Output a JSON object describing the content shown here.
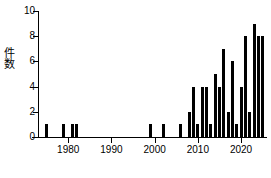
{
  "chart_data": {
    "type": "bar",
    "title": "",
    "xlabel": "",
    "ylabel": "件数",
    "xlim": [
      1973,
      2026
    ],
    "ylim": [
      0,
      10
    ],
    "grid": false,
    "legend": null,
    "xticks": [
      1980,
      1990,
      2000,
      2010,
      2020
    ],
    "xtick_labels": [
      "1980",
      "1990",
      "2000",
      "2010",
      "2020"
    ],
    "yticks": [
      0,
      2,
      4,
      6,
      8,
      10
    ],
    "ytick_labels": [
      "0",
      "2",
      "4",
      "6",
      "8",
      "10"
    ],
    "bar_color": "#000000",
    "categories": [
      1975,
      1976,
      1977,
      1978,
      1979,
      1980,
      1981,
      1982,
      1983,
      1984,
      1985,
      1986,
      1987,
      1988,
      1989,
      1990,
      1991,
      1992,
      1993,
      1994,
      1995,
      1996,
      1997,
      1998,
      1999,
      2000,
      2001,
      2002,
      2003,
      2004,
      2005,
      2006,
      2007,
      2008,
      2009,
      2010,
      2011,
      2012,
      2013,
      2014,
      2015,
      2016,
      2017,
      2018,
      2019,
      2020,
      2021,
      2022,
      2023,
      2024,
      2025
    ],
    "values": [
      1,
      0,
      0,
      0,
      1,
      0,
      1,
      1,
      0,
      0,
      0,
      0,
      0,
      0,
      0,
      0,
      0,
      0,
      0,
      0,
      0,
      0,
      0,
      0,
      1,
      0,
      0,
      1,
      0,
      0,
      0,
      1,
      0,
      2,
      4,
      1,
      4,
      4,
      1,
      5,
      4,
      7,
      2,
      6,
      1,
      4,
      8,
      2,
      9,
      8,
      8
    ]
  }
}
